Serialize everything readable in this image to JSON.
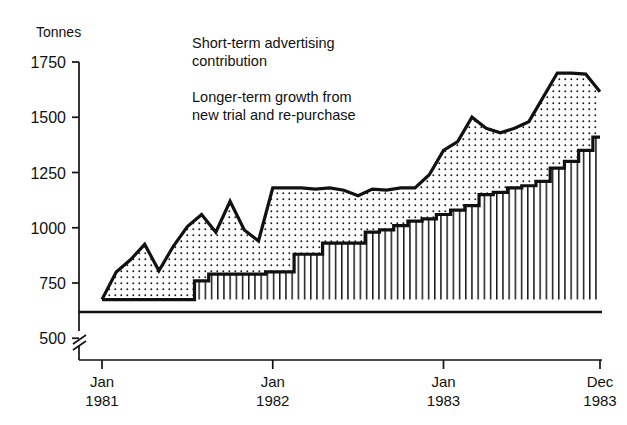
{
  "chart_data": {
    "type": "area",
    "title": "",
    "ylabel": "Tonnes",
    "xlabel": "",
    "ylim": [
      500,
      1750
    ],
    "yticks": [
      500,
      750,
      1000,
      1250,
      1500,
      1750
    ],
    "ytick_labels": [
      "500",
      "750",
      "1000",
      "1250",
      "1500",
      "1750"
    ],
    "axis_break_at": 500,
    "baseline_value": 675,
    "grid": false,
    "legend_position": "top-center",
    "stacking": "stacked-area",
    "xticks": [
      0,
      12,
      24,
      35
    ],
    "xtick_labels": [
      {
        "month": "Jan",
        "year": "1981"
      },
      {
        "month": "Jan",
        "year": "1982"
      },
      {
        "month": "Jan",
        "year": "1983"
      },
      {
        "month": "Dec",
        "year": "1983"
      }
    ],
    "x": [
      "Jan 1981",
      "Feb 1981",
      "Mar 1981",
      "Apr 1981",
      "May 1981",
      "Jun 1981",
      "Jul 1981",
      "Aug 1981",
      "Sep 1981",
      "Oct 1981",
      "Nov 1981",
      "Dec 1981",
      "Jan 1982",
      "Feb 1982",
      "Mar 1982",
      "Apr 1982",
      "May 1982",
      "Jun 1982",
      "Jul 1982",
      "Aug 1982",
      "Sep 1982",
      "Oct 1982",
      "Nov 1982",
      "Dec 1982",
      "Jan 1983",
      "Feb 1983",
      "Mar 1983",
      "Apr 1983",
      "May 1983",
      "Jun 1983",
      "Jul 1983",
      "Aug 1983",
      "Sep 1983",
      "Oct 1983",
      "Nov 1983",
      "Dec 1983"
    ],
    "series": [
      {
        "name": "Longer-term growth from new trial and re-purchase",
        "pattern": "vertical-hatch",
        "values": [
          675,
          675,
          675,
          675,
          675,
          675,
          675,
          760,
          790,
          790,
          790,
          790,
          800,
          800,
          880,
          880,
          930,
          930,
          930,
          980,
          990,
          1010,
          1030,
          1040,
          1060,
          1080,
          1100,
          1150,
          1160,
          1180,
          1190,
          1210,
          1270,
          1300,
          1350,
          1410
        ]
      },
      {
        "name": "Short-term advertising contribution",
        "pattern": "dotted",
        "values": [
          0,
          125,
          180,
          250,
          130,
          240,
          330,
          300,
          190,
          330,
          200,
          150,
          380,
          380,
          300,
          295,
          250,
          240,
          215,
          195,
          180,
          170,
          150,
          200,
          290,
          310,
          400,
          300,
          270,
          270,
          290,
          380,
          430,
          400,
          345,
          205
        ]
      }
    ],
    "totals": [
      675,
      800,
      855,
      925,
      805,
      915,
      1005,
      1060,
      980,
      1120,
      990,
      940,
      1180,
      1180,
      1180,
      1175,
      1180,
      1170,
      1145,
      1175,
      1170,
      1180,
      1180,
      1240,
      1350,
      1390,
      1500,
      1450,
      1430,
      1450,
      1480,
      1590,
      1700,
      1700,
      1695,
      1615
    ]
  },
  "legend": {
    "items": [
      {
        "swatch": "dotted-swatch",
        "line1": "Short-term advertising",
        "line2": "contribution"
      },
      {
        "swatch": "hatch-swatch",
        "line1": "Longer-term growth from",
        "line2": "new trial and re-purchase"
      }
    ]
  },
  "colors": {
    "ink": "#111111",
    "background": "#ffffff"
  }
}
